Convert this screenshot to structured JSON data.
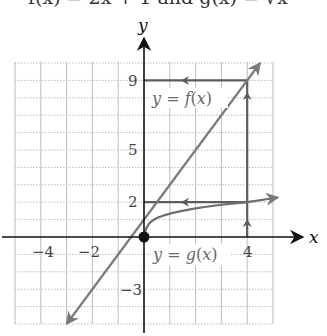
{
  "header": {
    "cropped_text": "f(x) = 2x + 1 and g(x) = √x"
  },
  "axes": {
    "x_label": "x",
    "y_label": "y",
    "x_range": [
      -5,
      5
    ],
    "y_range": [
      -5,
      10
    ],
    "x_tick_labels": [
      {
        "value": -4,
        "text": "−4"
      },
      {
        "value": -2,
        "text": "−2"
      },
      {
        "value": 4,
        "text": "4"
      }
    ],
    "y_tick_labels": [
      {
        "value": 9,
        "text": "9"
      },
      {
        "value": 5,
        "text": "5"
      },
      {
        "value": 2,
        "text": "2"
      },
      {
        "value": -3,
        "text": "−3"
      }
    ]
  },
  "curves": {
    "f": {
      "label": "y = f(x)",
      "label_prefix": "y = ",
      "label_fn": "f",
      "label_arg": "(x)",
      "equation": "y = 2x + 1",
      "from": [
        -3,
        -5
      ],
      "to": [
        4.5,
        10
      ]
    },
    "g": {
      "label": "y = g(x)",
      "label_prefix": "y = ",
      "label_fn": "g",
      "label_arg": "(x)",
      "equation": "y = √x",
      "from": [
        0,
        0
      ],
      "to": [
        5.2,
        2.28
      ]
    }
  },
  "guides": {
    "vertical_x4": {
      "x": 4,
      "from_y": 0,
      "to_y": 9,
      "direction": "up"
    },
    "horizontal_y2": {
      "y": 2,
      "from_x": 4,
      "to_x": 0,
      "direction": "left"
    },
    "horizontal_y9": {
      "y": 9,
      "from_x": 4,
      "to_x": 0,
      "direction": "left"
    }
  },
  "points": [
    {
      "name": "origin",
      "x": 0,
      "y": 0
    }
  ],
  "colors": {
    "axis": "#111111",
    "curve": "#7a7a7a",
    "guide": "#5c5c5c",
    "grid": "#bdbdbd",
    "label": "#6a6a6a"
  }
}
